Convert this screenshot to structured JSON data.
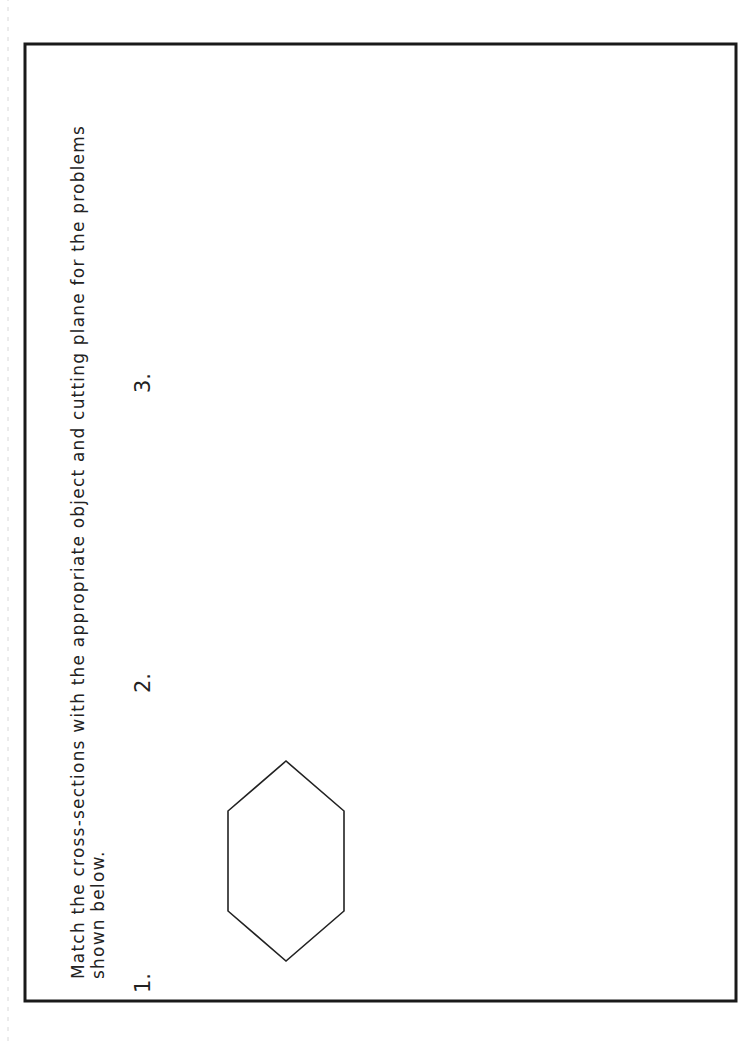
{
  "instructions": {
    "line1": "Match the cross-sections with the appropriate object and cutting plane for the problems",
    "line2": "shown below."
  },
  "problems": [
    {
      "number": "1.",
      "answer_blank": ""
    },
    {
      "number": "2.",
      "answer_blank": ""
    },
    {
      "number": "3.",
      "answer_blank": ""
    }
  ],
  "cross_sections": [
    {
      "label": "A",
      "shape": "two-rectangles"
    },
    {
      "label": "B",
      "shape": "square-with-circle"
    },
    {
      "label": "C",
      "shape": "rectangle-with-ellipse"
    }
  ],
  "title_block": {
    "name_label": "Name:",
    "class_label": "Class:",
    "section_label": "Section:",
    "date_label": "Date:",
    "title_line1": "Introduction to 3-D",
    "title_line2": "Spatial Visualization",
    "grade_label": "Grade:",
    "page_label": "Page",
    "page_number": "143"
  }
}
